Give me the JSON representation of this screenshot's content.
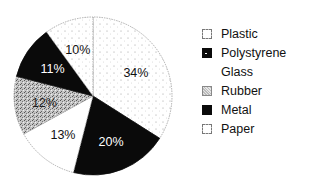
{
  "chart_data": {
    "type": "pie",
    "title": "",
    "start_angle": "12 o'clock",
    "direction": "clockwise",
    "slices": [
      {
        "category": "Plastic",
        "value": 34,
        "label": "34%",
        "fill": "dotted-white",
        "text_color": "#111111"
      },
      {
        "category": "Polystyrene",
        "value": 20,
        "label": "20%",
        "fill": "black",
        "text_color": "#ffffff"
      },
      {
        "category": "Glass",
        "value": 13,
        "label": "13%",
        "fill": "white",
        "text_color": "#111111"
      },
      {
        "category": "Rubber",
        "value": 12,
        "label": "12%",
        "fill": "gray-texture",
        "text_color": "#222222"
      },
      {
        "category": "Metal",
        "value": 11,
        "label": "11%",
        "fill": "black",
        "text_color": "#ffffff"
      },
      {
        "category": "Paper",
        "value": 10,
        "label": "10%",
        "fill": "dotted-white",
        "text_color": "#111111"
      }
    ],
    "categories": [
      "Plastic",
      "Polystyrene",
      "Glass",
      "Rubber",
      "Metal",
      "Paper"
    ],
    "values": [
      34,
      20,
      13,
      12,
      11,
      10
    ],
    "legend": {
      "position": "right",
      "entries": [
        {
          "label": "Plastic",
          "swatch": "dotted-white"
        },
        {
          "label": "Polystyrene",
          "swatch": "black-with-dot"
        },
        {
          "label": "Glass",
          "swatch": "none"
        },
        {
          "label": "Rubber",
          "swatch": "gray-texture"
        },
        {
          "label": "Metal",
          "swatch": "black"
        },
        {
          "label": "Paper",
          "swatch": "dotted-white"
        }
      ]
    }
  },
  "colors": {
    "black": "#0a0a0a",
    "white": "#ffffff",
    "gray_texture": "#b8b8b8",
    "outline": "#9a9a9a"
  }
}
